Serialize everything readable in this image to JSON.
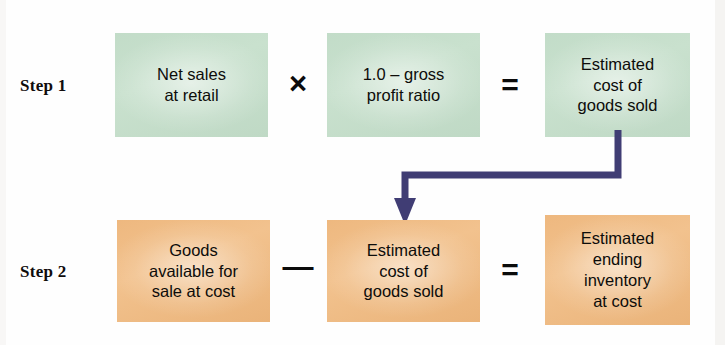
{
  "diagram": {
    "type": "process-flow",
    "colors": {
      "step1_box_fill": "#c9e1ce",
      "step2_box_fill": "#f2c28e",
      "arrow": "#403d74",
      "text": "#0d0c0a",
      "background": "#ffffff"
    },
    "steps": [
      {
        "label": "Step 1",
        "boxes": [
          {
            "name": "net-sales",
            "lines": [
              "Net sales",
              "at retail"
            ]
          },
          {
            "name": "gross-profit-ratio",
            "lines": [
              "1.0 – gross",
              "profit ratio"
            ]
          },
          {
            "name": "estimated-cost-of-goods-sold",
            "lines": [
              "Estimated",
              "cost of",
              "goods sold"
            ]
          }
        ],
        "operators": [
          "×",
          "="
        ]
      },
      {
        "label": "Step 2",
        "boxes": [
          {
            "name": "goods-available-for-sale",
            "lines": [
              "Goods",
              "available for",
              "sale at cost"
            ]
          },
          {
            "name": "estimated-cost-of-goods-sold",
            "lines": [
              "Estimated",
              "cost of",
              "goods sold"
            ]
          },
          {
            "name": "estimated-ending-inventory",
            "lines": [
              "Estimated",
              "ending",
              "inventory",
              "at cost"
            ]
          }
        ],
        "operators": [
          "—",
          "="
        ]
      }
    ],
    "connector": {
      "name": "cogs-carryforward-arrow",
      "from": "step1-estimated-cost-of-goods-sold",
      "to": "step2-estimated-cost-of-goods-sold",
      "color": "#403d74"
    }
  },
  "step1": {
    "label": "Step 1",
    "box1": {
      "line1": "Net sales",
      "line2": "at retail"
    },
    "op1": "×",
    "box2": {
      "line1": "1.0 – gross",
      "line2": "profit ratio"
    },
    "op2": "=",
    "box3": {
      "line1": "Estimated",
      "line2": "cost of",
      "line3": "goods sold"
    }
  },
  "step2": {
    "label": "Step 2",
    "box1": {
      "line1": "Goods",
      "line2": "available for",
      "line3": "sale at cost"
    },
    "op1": "—",
    "box2": {
      "line1": "Estimated",
      "line2": "cost of",
      "line3": "goods sold"
    },
    "op2": "=",
    "box3": {
      "line1": "Estimated",
      "line2": "ending",
      "line3": "inventory",
      "line4": "at cost"
    }
  }
}
